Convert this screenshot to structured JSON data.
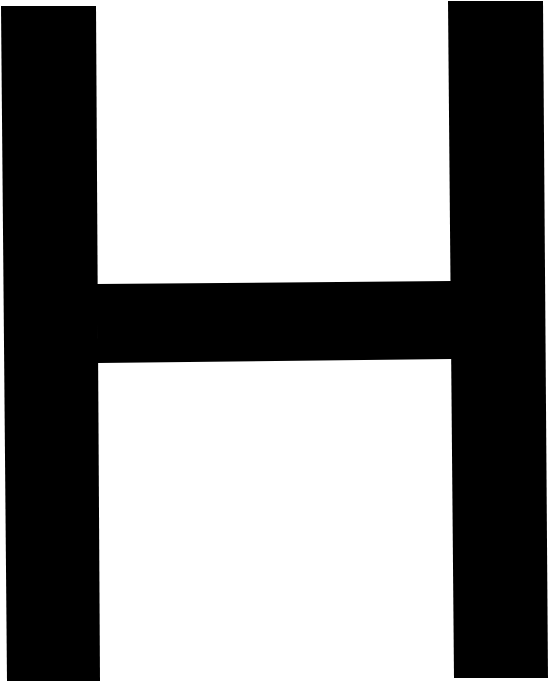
{
  "image": {
    "glyph": "H",
    "background_color": "#ffffff",
    "glyph_color": "#000000"
  }
}
